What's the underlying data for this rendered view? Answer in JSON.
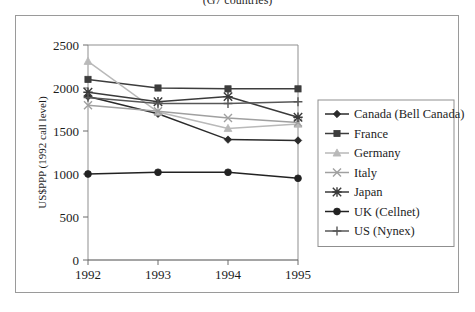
{
  "caption": {
    "clipped_line": "(G7 countries)"
  },
  "chart_data": {
    "type": "line",
    "title": "",
    "xlabel": "",
    "ylabel": "US$PPP (1992 call level)",
    "categories": [
      "1992",
      "1993",
      "1994",
      "1995"
    ],
    "x": [
      1992,
      1993,
      1994,
      1995
    ],
    "ylim": [
      0,
      2500
    ],
    "yticks": [
      0,
      500,
      1000,
      1500,
      2000,
      2500
    ],
    "ytick_labels": [
      "0",
      "500",
      "1000",
      "1500",
      "2000",
      "2500"
    ],
    "grid": false,
    "legend_position": "right",
    "series": [
      {
        "name": "Canada (Bell Canada)",
        "marker": "diamond",
        "color": "#2b2b2b",
        "values": [
          1900,
          1700,
          1400,
          1390
        ]
      },
      {
        "name": "France",
        "marker": "square",
        "color": "#3d3d3d",
        "values": [
          2100,
          2000,
          1990,
          1990
        ]
      },
      {
        "name": "Germany",
        "marker": "triangle",
        "color": "#b9b9b9",
        "values": [
          2310,
          1720,
          1530,
          1580
        ]
      },
      {
        "name": "Italy",
        "marker": "cross-x",
        "color": "#a0a0a0",
        "values": [
          1800,
          1730,
          1650,
          1600
        ]
      },
      {
        "name": "Japan",
        "marker": "asterisk",
        "color": "#3a3a3a",
        "values": [
          1950,
          1840,
          1900,
          1660
        ]
      },
      {
        "name": "UK (Cellnet)",
        "marker": "circle",
        "color": "#222222",
        "values": [
          1000,
          1020,
          1020,
          950
        ]
      },
      {
        "name": "US (Nynex)",
        "marker": "plus",
        "color": "#575757",
        "values": [
          1890,
          1820,
          1820,
          1840
        ]
      }
    ]
  }
}
